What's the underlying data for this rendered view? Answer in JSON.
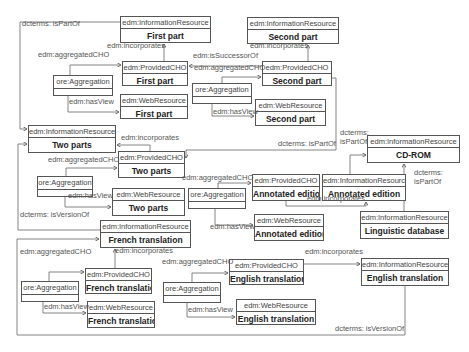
{
  "boxes": [
    {
      "id": "ir-first",
      "cls": "edm:InformationResource",
      "name": "First part",
      "x": 120,
      "y": 16,
      "w": 91,
      "h": 27
    },
    {
      "id": "cho-first",
      "cls": "edm:ProvidedCHO",
      "name": "First part",
      "x": 122,
      "y": 61,
      "w": 66,
      "h": 25
    },
    {
      "id": "wr-first",
      "cls": "edm:WebResource",
      "name": "First part",
      "x": 120,
      "y": 94,
      "w": 68,
      "h": 25
    },
    {
      "id": "agg-first",
      "cls": "ore:Aggregation",
      "name": "",
      "x": 53,
      "y": 75,
      "w": 60,
      "h": 21,
      "agg": true
    },
    {
      "id": "ir-second",
      "cls": "edm:InformationResource",
      "name": "Second part",
      "x": 247,
      "y": 17,
      "w": 92,
      "h": 27
    },
    {
      "id": "cho-second",
      "cls": "edm:ProvidedCHO",
      "name": "Second part",
      "x": 262,
      "y": 61,
      "w": 70,
      "h": 25
    },
    {
      "id": "wr-second",
      "cls": "edm:WebResource",
      "name": "Second part",
      "x": 255,
      "y": 99,
      "w": 71,
      "h": 27
    },
    {
      "id": "agg-second",
      "cls": "ore:Aggregation",
      "name": "",
      "x": 192,
      "y": 83,
      "w": 60,
      "h": 21,
      "agg": true
    },
    {
      "id": "ir-two",
      "cls": "edm:InformationResource",
      "name": "Two parts",
      "x": 28,
      "y": 125,
      "w": 88,
      "h": 28
    },
    {
      "id": "cho-two",
      "cls": "edm:ProvidedCHO",
      "name": "Two parts",
      "x": 118,
      "y": 151,
      "w": 67,
      "h": 27
    },
    {
      "id": "wr-two",
      "cls": "edm:WebResource",
      "name": "Two parts",
      "x": 112,
      "y": 188,
      "w": 73,
      "h": 28
    },
    {
      "id": "agg-two",
      "cls": "ore:Aggregation",
      "name": "",
      "x": 37,
      "y": 176,
      "w": 56,
      "h": 21,
      "agg": true
    },
    {
      "id": "ir-cdrom",
      "cls": "edm:InformationResource",
      "name": "CD-ROM",
      "x": 367,
      "y": 135,
      "w": 93,
      "h": 28
    },
    {
      "id": "ir-annot",
      "cls": "edm:InformationResource",
      "name": "Annotated edition",
      "x": 322,
      "y": 174,
      "w": 84,
      "h": 27
    },
    {
      "id": "cho-annot",
      "cls": "edm:ProvidedCHO",
      "name": "Annotated edition",
      "x": 252,
      "y": 174,
      "w": 68,
      "h": 27
    },
    {
      "id": "wr-annot",
      "cls": "edm:WebResource",
      "name": "Annotated edition",
      "x": 254,
      "y": 214,
      "w": 70,
      "h": 27
    },
    {
      "id": "agg-annot",
      "cls": "ore:Aggregation",
      "name": "",
      "x": 188,
      "y": 188,
      "w": 58,
      "h": 21,
      "agg": true
    },
    {
      "id": "ir-ling",
      "cls": "edm:InformationResource",
      "name": "Linguistic database",
      "x": 360,
      "y": 211,
      "w": 89,
      "h": 28
    },
    {
      "id": "ir-french",
      "cls": "edm:InformationResource",
      "name": "French translation",
      "x": 100,
      "y": 220,
      "w": 91,
      "h": 28
    },
    {
      "id": "cho-french",
      "cls": "edm:ProvidedCHO",
      "name": "French translation",
      "x": 85,
      "y": 268,
      "w": 67,
      "h": 26
    },
    {
      "id": "wr-french",
      "cls": "edm:WebResource",
      "name": "French translation",
      "x": 87,
      "y": 301,
      "w": 68,
      "h": 27
    },
    {
      "id": "agg-french",
      "cls": "ore:Aggregation",
      "name": "",
      "x": 21,
      "y": 281,
      "w": 58,
      "h": 21,
      "agg": true
    },
    {
      "id": "cho-english",
      "cls": "edm:ProvidedCHO",
      "name": "English translation",
      "x": 229,
      "y": 259,
      "w": 75,
      "h": 26
    },
    {
      "id": "wr-english",
      "cls": "edm:WebResource",
      "name": "English translation",
      "x": 236,
      "y": 299,
      "w": 80,
      "h": 26
    },
    {
      "id": "agg-english",
      "cls": "ore:Aggregation",
      "name": "",
      "x": 163,
      "y": 282,
      "w": 58,
      "h": 21,
      "agg": true
    },
    {
      "id": "ir-english",
      "cls": "edm:InformationResource",
      "name": "English translation",
      "x": 361,
      "y": 258,
      "w": 88,
      "h": 28
    }
  ],
  "labels": [
    {
      "text": "dcterms: isPartOf",
      "x": 22,
      "y": 26
    },
    {
      "text": "edm:incorporates",
      "x": 107,
      "y": 48
    },
    {
      "text": "edm:aggregatedCHO",
      "x": 38,
      "y": 57
    },
    {
      "text": "edm:hasView",
      "x": 69,
      "y": 104
    },
    {
      "text": "edm:isSuccessorOf",
      "x": 193,
      "y": 58
    },
    {
      "text": "edm:incorporates",
      "x": 250,
      "y": 48
    },
    {
      "text": "edm:aggregatedCHO",
      "x": 194,
      "y": 70
    },
    {
      "text": "edm:hasView",
      "x": 213,
      "y": 114
    },
    {
      "text": "dcterms: isPartOf",
      "x": 278,
      "y": 146
    },
    {
      "text": "edm:incorporates",
      "x": 121,
      "y": 140
    },
    {
      "text": "edm:aggregatedCHO",
      "x": 48,
      "y": 162
    },
    {
      "text": "edm:hasView",
      "x": 68,
      "y": 198
    },
    {
      "text": "dcterms:",
      "x": 340,
      "y": 135
    },
    {
      "text": "isPartOf",
      "x": 340,
      "y": 144
    },
    {
      "text": "dcterms:",
      "x": 414,
      "y": 175
    },
    {
      "text": "isPartOf",
      "x": 414,
      "y": 184
    },
    {
      "text": "edm:aggregatedCHO",
      "x": 182,
      "y": 180
    },
    {
      "text": "edm:incorporates",
      "x": 307,
      "y": 201
    },
    {
      "text": "edm:hasView",
      "x": 210,
      "y": 229
    },
    {
      "text": "dcterms: isVersionOf",
      "x": 20,
      "y": 217
    },
    {
      "text": "edm:aggregatedCHO",
      "x": 20,
      "y": 254
    },
    {
      "text": "edm:incorporates",
      "x": 115,
      "y": 253
    },
    {
      "text": "edm:hasView",
      "x": 44,
      "y": 309
    },
    {
      "text": "edm:aggregatedCHO",
      "x": 162,
      "y": 264
    },
    {
      "text": "edm:incorporates",
      "x": 305,
      "y": 254
    },
    {
      "text": "edm:hasView",
      "x": 188,
      "y": 312
    },
    {
      "text": "dcterms: isVersionOf",
      "x": 335,
      "y": 331
    }
  ]
}
